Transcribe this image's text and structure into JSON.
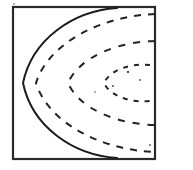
{
  "figure": {
    "title": "",
    "caption": "",
    "background_color": "#ffffff",
    "line_color": "#1c1c1c",
    "frame_color": "#2a2a2a",
    "width": 193,
    "height": 170
  },
  "chart_data": {
    "type": "line",
    "title": "",
    "xlabel": "",
    "ylabel": "",
    "grid": false,
    "legend": "none",
    "frame": {
      "left": 13,
      "top": 7,
      "right": 155,
      "bottom": 159
    },
    "symmetry_axis_y": 83,
    "series": [
      {
        "name": "contour-1-solid",
        "style": "solid",
        "vertex_x": 23,
        "vertex_y": 83,
        "opens": "right",
        "end_x": 117,
        "top_end_y": 7,
        "bottom_end_y": 159,
        "path": "M 117 8 C 72 11 32 40 23 83 C 32 126 72 155 117 158"
      },
      {
        "name": "contour-2-dashed",
        "style": "dashed",
        "vertex_x": 36,
        "vertex_y": 83,
        "opens": "right",
        "end_x": 155,
        "top_end_y": 13,
        "bottom_end_y": 153,
        "path": "M 155 14 C 100 16 48 44 36 83 C 48 122 100 150 155 152"
      },
      {
        "name": "contour-3-dashed",
        "style": "dashed",
        "vertex_x": 68,
        "vertex_y": 83,
        "opens": "right",
        "end_x": 155,
        "top_end_y": 40,
        "bottom_end_y": 126,
        "path": "M 155 41 C 115 42 79 58 68 83 C 79 108 115 124 155 125"
      },
      {
        "name": "contour-4-dashed",
        "style": "dashed",
        "vertex_x": 104,
        "vertex_y": 83,
        "opens": "right",
        "end_x": 150,
        "top_end_y": 64,
        "bottom_end_y": 102,
        "path": "M 150 65 C 130 63 110 70 104 83 C 110 96 130 103 150 101"
      }
    ]
  },
  "annotations": {
    "speckles": [
      {
        "x": 128,
        "y": 72,
        "r": 1.2
      },
      {
        "x": 113,
        "y": 86,
        "r": 1.0
      },
      {
        "x": 140,
        "y": 80,
        "r": 0.9
      },
      {
        "x": 95,
        "y": 92,
        "r": 0.8
      },
      {
        "x": 150,
        "y": 145,
        "r": 0.9
      },
      {
        "x": 14,
        "y": 4,
        "r": 0.8
      }
    ]
  }
}
